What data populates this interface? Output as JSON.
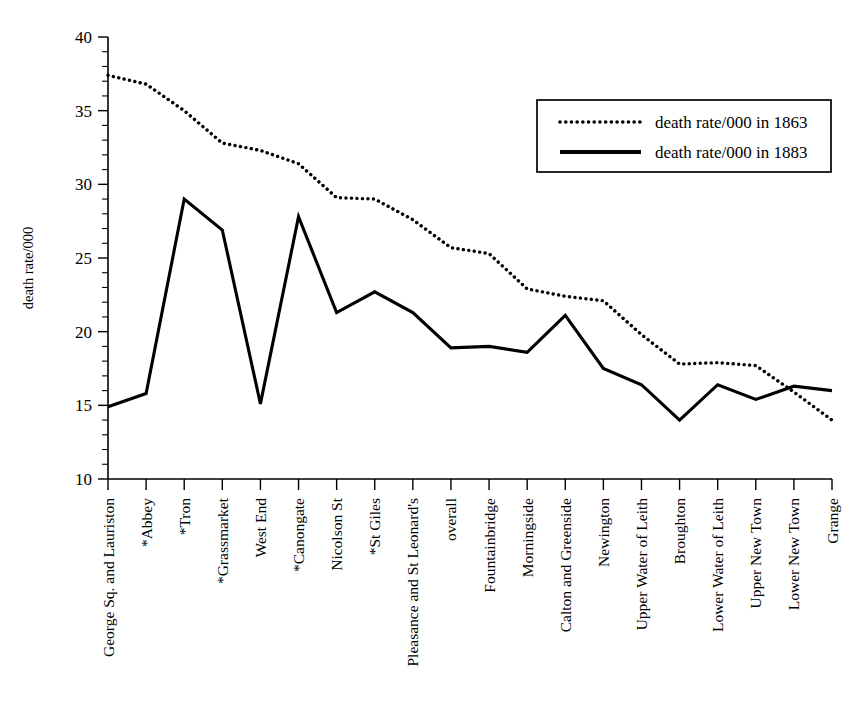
{
  "chart_data": {
    "type": "line",
    "title": "",
    "xlabel": "",
    "ylabel": "death rate/000",
    "ylim": [
      10,
      40
    ],
    "ytick_labels": [
      "40",
      "35",
      "30",
      "25",
      "20",
      "15",
      "10"
    ],
    "ytick_values": [
      40,
      35,
      30,
      25,
      20,
      15,
      10
    ],
    "minor_tick_step": 1,
    "grid": false,
    "legend_position": "upper right",
    "categories": [
      "George Sq. and Lauriston",
      "*Abbey",
      "*Tron",
      "*Grassmarket",
      "West End",
      "*Canongate",
      "Nicolson St",
      "*St Giles",
      "Pleasance and St Leonard's",
      "overall",
      "Fountainbridge",
      "Morningside",
      "Calton and Greenside",
      "Newington",
      "Upper Water of Leith",
      "Broughton",
      "Lower Water of Leith",
      "Upper New Town",
      "Lower New Town",
      "Grange"
    ],
    "series": [
      {
        "name": "death rate/000 in 1863",
        "style": "dotted",
        "values": [
          37.4,
          36.8,
          35.0,
          32.8,
          32.3,
          31.4,
          29.1,
          29.0,
          27.6,
          25.7,
          25.3,
          22.9,
          22.4,
          22.1,
          19.8,
          17.8,
          17.9,
          17.7,
          15.9,
          14.0
        ]
      },
      {
        "name": "death rate/000 in 1883",
        "style": "solid",
        "values": [
          14.9,
          15.8,
          29.0,
          26.9,
          15.1,
          27.8,
          21.3,
          22.7,
          21.3,
          18.9,
          19.0,
          18.6,
          21.1,
          17.5,
          16.4,
          14.0,
          16.4,
          15.4,
          16.3,
          16.0
        ]
      }
    ]
  },
  "legend": {
    "entries": [
      {
        "label": "death rate/000 in 1863",
        "style": "dotted"
      },
      {
        "label": "death rate/000 in 1883",
        "style": "solid"
      }
    ]
  },
  "axes": {
    "y_title": "death rate/000"
  }
}
